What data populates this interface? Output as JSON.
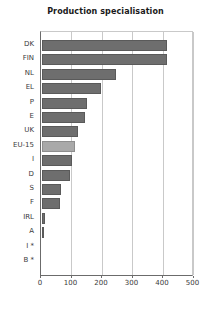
{
  "chart_data": {
    "type": "bar",
    "orientation": "horizontal",
    "title": "Production specialisation",
    "xlabel": "",
    "ylabel": "",
    "xlim": [
      0,
      500
    ],
    "xticks": [
      0,
      100,
      200,
      300,
      400,
      500
    ],
    "grid": true,
    "legend": "none",
    "categories": [
      "DK",
      "FIN",
      "NL",
      "EL",
      "P",
      "E",
      "UK",
      "EU-15",
      "I",
      "D",
      "S",
      "F",
      "IRL",
      "A",
      "I *",
      "B *"
    ],
    "values": [
      413,
      410,
      243,
      195,
      150,
      143,
      120,
      110,
      100,
      94,
      65,
      61,
      12,
      3,
      0,
      0
    ],
    "highlight_category": "EU-15",
    "colors": {
      "bar": "#6e6e6e",
      "bar_border": "#5a5a5a",
      "highlight": "#a9a9a9",
      "highlight_border": "#8e8e8e",
      "axis": "#6b6b6b",
      "grid": "#c9c9c9",
      "text": "#3a3a3a",
      "title": "#1a1a1a",
      "background": "#ffffff"
    }
  }
}
